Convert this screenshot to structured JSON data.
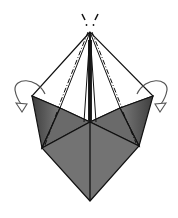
{
  "diagram": {
    "type": "origami-fold-step",
    "colors": {
      "background": "#ffffff",
      "line": "#111111",
      "paper_dark": "#4a4a4a",
      "paper_mid": "#6e6e6e",
      "paper_light": "#8a8a8a",
      "arrow": "#555555"
    },
    "symbols": {
      "apex_marks": "repeat / view marks above apex",
      "left_arrow": "fold-behind arrow (left flap)",
      "right_arrow": "fold-behind arrow (right flap)",
      "fold_lines": "dash-dot mountain fold lines from apex to flap corners"
    }
  }
}
